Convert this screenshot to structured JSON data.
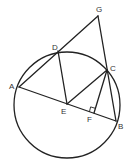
{
  "diagram": {
    "type": "geometry",
    "circle": {
      "cx": 67,
      "cy": 105,
      "r": 53
    },
    "points": {
      "A": {
        "x": 19,
        "y": 87,
        "lx": 9,
        "ly": 89,
        "label": "A"
      },
      "B": {
        "x": 116,
        "y": 121,
        "lx": 118,
        "ly": 129,
        "label": "B"
      },
      "C": {
        "x": 107,
        "y": 70,
        "lx": 110,
        "ly": 71,
        "label": "C"
      },
      "D": {
        "x": 58,
        "y": 51,
        "lx": 52,
        "ly": 50,
        "label": "D"
      },
      "E": {
        "x": 67,
        "y": 104,
        "lx": 61,
        "ly": 114,
        "label": "E"
      },
      "F": {
        "x": 94,
        "y": 113,
        "lx": 87,
        "ly": 122,
        "label": "F"
      },
      "G": {
        "x": 98,
        "y": 16,
        "lx": 96,
        "ly": 12,
        "label": "G"
      }
    },
    "segments": [
      "AB",
      "AG",
      "GB",
      "DE",
      "EC",
      "CF"
    ],
    "right_angle_at": "F",
    "stroke_color": "#222222"
  }
}
